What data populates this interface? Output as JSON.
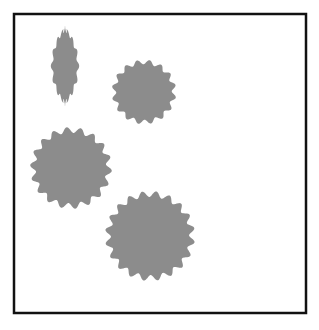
{
  "figure": {
    "canvas": {
      "width": 319,
      "height": 330,
      "background_color": "#ffffff"
    },
    "frame": {
      "label": "image-border-frame",
      "x": 14,
      "y": 14,
      "width": 292,
      "height": 299,
      "stroke_color": "#111111",
      "stroke_width": 2.5,
      "fill_color": "#ffffff"
    },
    "blobs": [
      {
        "id": "blob-1",
        "label": "elongated-vertical-blob",
        "fill_color": "#8c8c8c",
        "center_x": 65,
        "center_y": 66,
        "radius_x": 13,
        "radius_y": 37,
        "lobes": 16,
        "lobe_depth": 0.09,
        "rotation": 0,
        "taper": true
      },
      {
        "id": "blob-2",
        "label": "small-round-blob",
        "fill_color": "#8c8c8c",
        "center_x": 144,
        "center_y": 92,
        "radius_x": 30,
        "radius_y": 30,
        "lobes": 16,
        "lobe_depth": 0.075,
        "rotation": 10,
        "taper": false
      },
      {
        "id": "blob-3",
        "label": "medium-round-blob",
        "fill_color": "#8c8c8c",
        "center_x": 71,
        "center_y": 168,
        "radius_x": 38,
        "radius_y": 38,
        "lobes": 18,
        "lobe_depth": 0.075,
        "rotation": 4,
        "taper": false
      },
      {
        "id": "blob-4",
        "label": "large-round-blob",
        "fill_color": "#8c8c8c",
        "center_x": 150,
        "center_y": 236,
        "radius_x": 42,
        "radius_y": 42,
        "lobes": 20,
        "lobe_depth": 0.07,
        "rotation": 8,
        "taper": false
      }
    ]
  }
}
